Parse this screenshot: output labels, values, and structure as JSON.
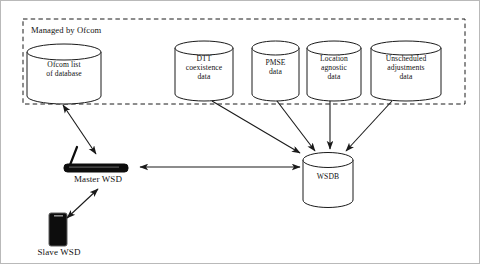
{
  "figure": {
    "type": "block-diagram",
    "background": "#ffffff",
    "stroke_color": "#1a1a1a",
    "device_fill": "#0d0d0d",
    "border_color": "#b9b9b9"
  },
  "zone": {
    "label": "Managed by Ofcom",
    "style": "dashed",
    "x": 22,
    "y": 18,
    "w": 442,
    "h": 85
  },
  "databases": [
    {
      "id": "ofcom-list",
      "label": "Ofcom list\nof database",
      "x": 26,
      "y": 43,
      "w": 74,
      "h": 60
    },
    {
      "id": "dtt-coexistence",
      "label": "DTT\ncoexistence\ndata",
      "x": 174,
      "y": 39,
      "w": 58,
      "h": 61
    },
    {
      "id": "pmse",
      "label": "PMSE\ndata",
      "x": 251,
      "y": 39,
      "w": 47,
      "h": 61
    },
    {
      "id": "location-agnostic",
      "label": "Location\nagnostic\ndata",
      "x": 306,
      "y": 39,
      "w": 54,
      "h": 61
    },
    {
      "id": "unscheduled-adjustments",
      "label": "Unscheduled\nadjustments\ndata",
      "x": 370,
      "y": 39,
      "w": 70,
      "h": 61
    },
    {
      "id": "wsdb",
      "label": "WSDB",
      "x": 302,
      "y": 151,
      "w": 50,
      "h": 55
    }
  ],
  "devices": [
    {
      "id": "master-wsd",
      "label": "Master WSD",
      "icon": "wireless-router-icon"
    },
    {
      "id": "slave-wsd",
      "label": "Slave WSD",
      "icon": "mobile-phone-icon"
    }
  ],
  "connections": [
    {
      "from": "ofcom-list",
      "to": "master-wsd",
      "arrow": "double"
    },
    {
      "from": "master-wsd",
      "to": "wsdb",
      "arrow": "double"
    },
    {
      "from": "master-wsd",
      "to": "slave-wsd",
      "arrow": "double"
    },
    {
      "from": "dtt-coexistence",
      "to": "wsdb",
      "arrow": "single"
    },
    {
      "from": "pmse",
      "to": "wsdb",
      "arrow": "single"
    },
    {
      "from": "location-agnostic",
      "to": "wsdb",
      "arrow": "single"
    },
    {
      "from": "unscheduled-adjustments",
      "to": "wsdb",
      "arrow": "single"
    }
  ]
}
